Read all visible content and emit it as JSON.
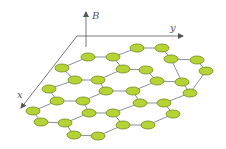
{
  "diagram": {
    "axes": {
      "z_label": "B",
      "y_label": "y",
      "x_label": "x"
    },
    "colors": {
      "atom_fill": "#b5d334",
      "atom_stroke": "#6f8a1c",
      "bond": "#8a8f9c",
      "axis": "#555555"
    },
    "atoms": [
      [
        88,
        57
      ],
      [
        113,
        57
      ],
      [
        137,
        48
      ],
      [
        162,
        48
      ],
      [
        62,
        68
      ],
      [
        123,
        69
      ],
      [
        146,
        70
      ],
      [
        171,
        59
      ],
      [
        197,
        60
      ],
      [
        75,
        80
      ],
      [
        98,
        80
      ],
      [
        157,
        81
      ],
      [
        182,
        82
      ],
      [
        206,
        71
      ],
      [
        49,
        89
      ],
      [
        106,
        91
      ],
      [
        133,
        91
      ],
      [
        190,
        93
      ],
      [
        57,
        101
      ],
      [
        83,
        101
      ],
      [
        140,
        103
      ],
      [
        164,
        103
      ],
      [
        33,
        111
      ],
      [
        89,
        113
      ],
      [
        113,
        113
      ],
      [
        173,
        114
      ],
      [
        41,
        122
      ],
      [
        65,
        123
      ],
      [
        123,
        125
      ],
      [
        148,
        125
      ],
      [
        74,
        135
      ],
      [
        98,
        136
      ]
    ],
    "bonds": [
      [
        0,
        1
      ],
      [
        1,
        2
      ],
      [
        2,
        3
      ],
      [
        0,
        4
      ],
      [
        1,
        5
      ],
      [
        5,
        6
      ],
      [
        3,
        7
      ],
      [
        7,
        8
      ],
      [
        4,
        9
      ],
      [
        9,
        10
      ],
      [
        5,
        10
      ],
      [
        6,
        11
      ],
      [
        11,
        12
      ],
      [
        7,
        12
      ],
      [
        8,
        13
      ],
      [
        9,
        14
      ],
      [
        10,
        15
      ],
      [
        15,
        16
      ],
      [
        11,
        16
      ],
      [
        12,
        17
      ],
      [
        13,
        17
      ],
      [
        14,
        18
      ],
      [
        18,
        19
      ],
      [
        15,
        19
      ],
      [
        16,
        20
      ],
      [
        20,
        21
      ],
      [
        17,
        21
      ],
      [
        18,
        22
      ],
      [
        19,
        23
      ],
      [
        23,
        24
      ],
      [
        20,
        24
      ],
      [
        21,
        25
      ],
      [
        22,
        26
      ],
      [
        26,
        27
      ],
      [
        23,
        27
      ],
      [
        24,
        28
      ],
      [
        28,
        29
      ],
      [
        25,
        29
      ],
      [
        27,
        30
      ],
      [
        30,
        31
      ],
      [
        28,
        31
      ]
    ]
  }
}
